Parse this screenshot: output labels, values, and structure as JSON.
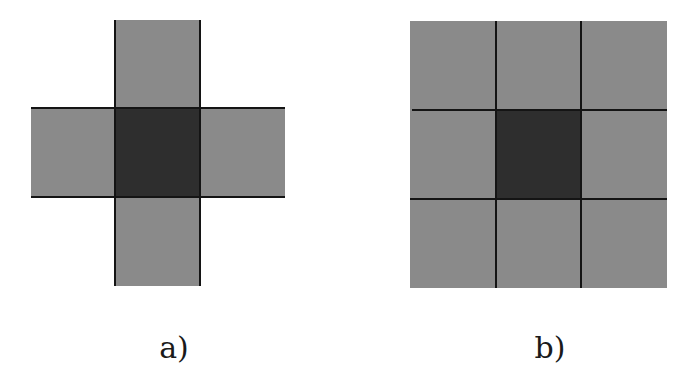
{
  "figures": [
    {
      "id": "a",
      "label": "a)",
      "shape": "cross (von Neumann neighborhood)",
      "cells": [
        "top",
        "left",
        "center",
        "right",
        "bottom"
      ],
      "center_cell": "center"
    },
    {
      "id": "b",
      "label": "b)",
      "shape": "3x3 grid (Moore neighborhood)",
      "grid_size": [
        3,
        3
      ],
      "center_cell": [
        1,
        1
      ]
    }
  ],
  "colors": {
    "background": "#ffffff",
    "neighbor_cell": "#8a8a8a",
    "center_cell": "#2e2e2e",
    "grid_line": "#141414",
    "label_text": "#1a1a1a"
  }
}
